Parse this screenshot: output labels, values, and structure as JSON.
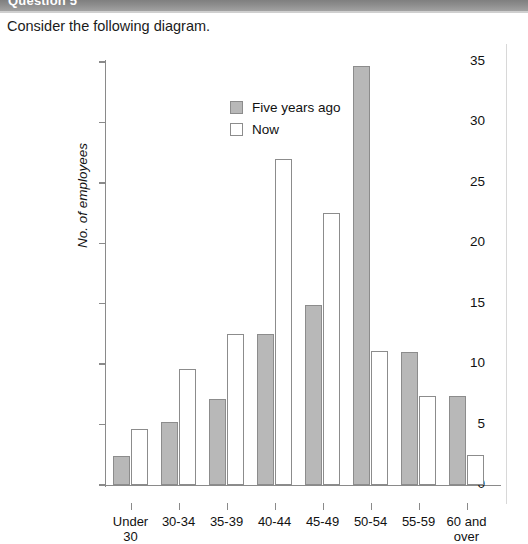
{
  "header": {
    "question_label": "Question 5"
  },
  "prompt": {
    "text": "Consider the following diagram."
  },
  "chart_data": {
    "type": "bar",
    "title": "",
    "xlabel": "",
    "ylabel": "No. of employees",
    "ylim": [
      0,
      35
    ],
    "yticks": [
      0,
      5,
      10,
      15,
      20,
      25,
      30,
      35
    ],
    "grid": false,
    "legend_position": "top-left-inside",
    "categories": [
      "Under\n30",
      "30-34",
      "35-39",
      "40-44",
      "45-49",
      "50-54",
      "55-59",
      "60 and\nover"
    ],
    "series": [
      {
        "name": "Five years ago",
        "color": "#b8b8b8",
        "values": [
          2.4,
          5.2,
          7.1,
          12.5,
          14.9,
          34.7,
          11.0,
          7.4
        ]
      },
      {
        "name": "Now",
        "color": "#ffffff",
        "values": [
          4.6,
          9.6,
          12.5,
          27.0,
          22.5,
          11.1,
          7.4,
          2.5
        ]
      }
    ]
  },
  "colors": {
    "series_past": "#b8b8b8",
    "series_now": "#ffffff",
    "bar_outline": "#8c8c8c",
    "axis": "#8a8a8a",
    "header_band": "#8d8d8d",
    "text": "#111111"
  }
}
